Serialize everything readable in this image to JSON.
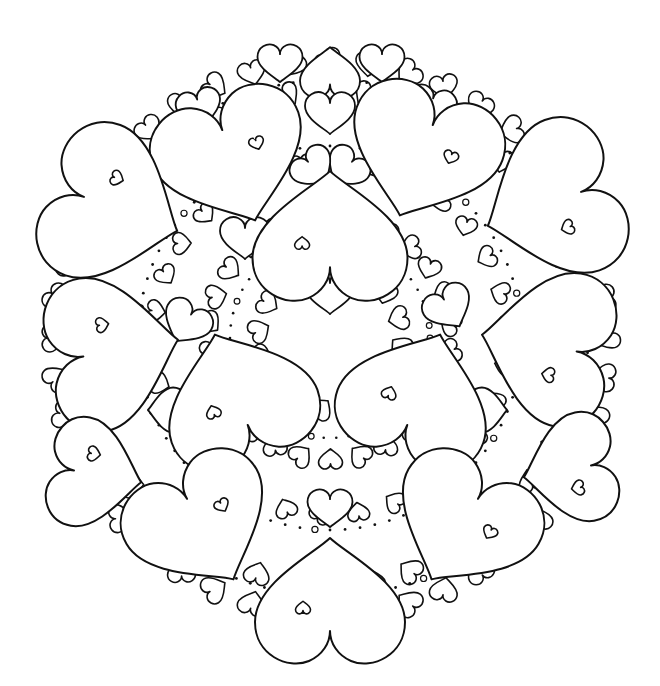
{
  "image": {
    "description": "Black and white heart mandala coloring page",
    "width": 660,
    "height": 686,
    "background": "#ffffff",
    "line_color": "#111111"
  },
  "mandala": {
    "center": [
      330,
      338
    ],
    "radius": 300,
    "large_hearts": [
      {
        "x": 235,
        "y": 165,
        "s": 1.55,
        "r": -20
      },
      {
        "x": 420,
        "y": 160,
        "s": 1.55,
        "r": 20
      },
      {
        "x": 120,
        "y": 210,
        "s": 1.6,
        "r": -70
      },
      {
        "x": 545,
        "y": 205,
        "s": 1.6,
        "r": 70
      },
      {
        "x": 330,
        "y": 230,
        "s": 1.55,
        "r": 180
      },
      {
        "x": 120,
        "y": 350,
        "s": 1.55,
        "r": -100
      },
      {
        "x": 540,
        "y": 345,
        "s": 1.55,
        "r": 100
      },
      {
        "x": 235,
        "y": 390,
        "s": 1.55,
        "r": 160
      },
      {
        "x": 420,
        "y": 390,
        "s": 1.55,
        "r": -160
      },
      {
        "x": 205,
        "y": 530,
        "s": 1.5,
        "r": -30
      },
      {
        "x": 460,
        "y": 530,
        "s": 1.5,
        "r": 30
      },
      {
        "x": 100,
        "y": 475,
        "s": 1.1,
        "r": -80
      },
      {
        "x": 565,
        "y": 470,
        "s": 1.1,
        "r": 80
      },
      {
        "x": 330,
        "y": 595,
        "s": 1.5,
        "r": 180
      }
    ],
    "medium_hearts": [
      {
        "x": 330,
        "y": 70,
        "s": 0.6,
        "r": 180
      },
      {
        "x": 280,
        "y": 65,
        "s": 0.45,
        "r": 0
      },
      {
        "x": 382,
        "y": 65,
        "s": 0.45,
        "r": 0
      },
      {
        "x": 330,
        "y": 115,
        "s": 0.5,
        "r": 0
      },
      {
        "x": 245,
        "y": 240,
        "s": 0.5,
        "r": 0
      },
      {
        "x": 330,
        "y": 295,
        "s": 0.5,
        "r": 0
      },
      {
        "x": 330,
        "y": 510,
        "s": 0.45,
        "r": 0
      },
      {
        "x": 430,
        "y": 110,
        "s": 0.5,
        "r": 15
      },
      {
        "x": 200,
        "y": 110,
        "s": 0.45,
        "r": -15
      },
      {
        "x": 345,
        "y": 170,
        "s": 0.45,
        "r": 40
      },
      {
        "x": 315,
        "y": 170,
        "s": 0.45,
        "r": -40
      },
      {
        "x": 450,
        "y": 310,
        "s": 0.5,
        "r": -30
      },
      {
        "x": 185,
        "y": 325,
        "s": 0.5,
        "r": 30
      },
      {
        "x": 165,
        "y": 410,
        "s": 0.45,
        "r": 90
      },
      {
        "x": 490,
        "y": 410,
        "s": 0.45,
        "r": -90
      },
      {
        "x": 290,
        "y": 620,
        "s": 0.4,
        "r": 0
      },
      {
        "x": 372,
        "y": 620,
        "s": 0.4,
        "r": 0
      }
    ],
    "inner_heart_scale": 0.15,
    "small_heart_rings": [
      {
        "radius": 275,
        "count": 44,
        "scale": 0.28
      },
      {
        "radius": 245,
        "count": 40,
        "scale": 0.26
      },
      {
        "radius": 120,
        "count": 26,
        "scale": 0.24
      },
      {
        "radius": 70,
        "count": 16,
        "scale": 0.24
      },
      {
        "radius": 175,
        "count": 30,
        "scale": 0.22
      }
    ],
    "dot_rings": [
      {
        "radius": 258,
        "count": 110,
        "size": 1.4
      },
      {
        "radius": 192,
        "count": 80,
        "size": 1.4
      },
      {
        "radius": 100,
        "count": 50,
        "size": 1.3
      }
    ]
  }
}
